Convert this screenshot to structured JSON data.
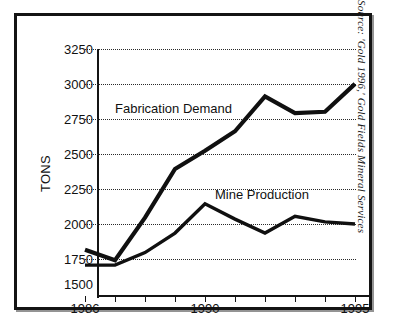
{
  "figure": {
    "source_note": "Source: 'Gold 1996,' Gold Fields Mineral Services"
  },
  "chart_data": {
    "type": "line",
    "title": "",
    "xlabel": "",
    "ylabel": "TONS",
    "grid": true,
    "legend_position": "inline-annotation",
    "xlim": [
      1986,
      1995
    ],
    "ylim": [
      1500,
      3250
    ],
    "ytick_step": 250,
    "categories": [
      1986,
      1987,
      1988,
      1989,
      1990,
      1991,
      1992,
      1993,
      1994,
      1995
    ],
    "xtick_labels": [
      "1986",
      "",
      "",
      "",
      "1990",
      "",
      "",
      "",
      "",
      "1995"
    ],
    "ytick_labels": [
      "3250",
      "3000",
      "2750",
      "2500",
      "2250",
      "2000",
      "1750",
      "1500"
    ],
    "ytick_values": [
      3250,
      3000,
      2750,
      2500,
      2250,
      2000,
      1750,
      1500
    ],
    "series": [
      {
        "name": "Fabrication Demand",
        "values": [
          1810,
          1735,
          2040,
          2390,
          2520,
          2660,
          2910,
          2790,
          2800,
          3000
        ],
        "color": "#101010"
      },
      {
        "name": "Mine Production",
        "values": [
          1700,
          1700,
          1790,
          1930,
          2140,
          2030,
          1930,
          2050,
          2010,
          1995
        ],
        "color": "#101010"
      }
    ],
    "annotations": [
      {
        "text": "Fabrication Demand",
        "x": 1987.1,
        "y": 2660
      },
      {
        "text": "Mine Production",
        "x": 1990.8,
        "y": 2255
      }
    ]
  }
}
